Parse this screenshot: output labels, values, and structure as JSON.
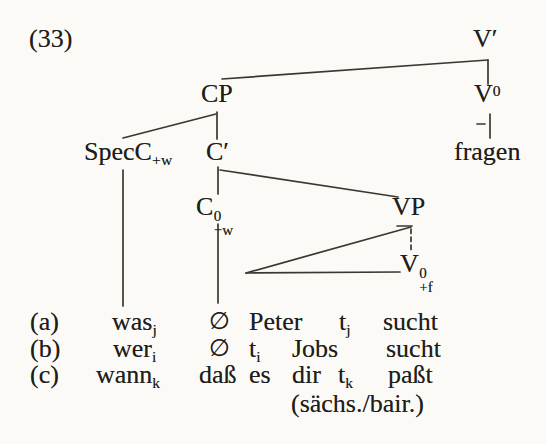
{
  "page": {
    "bg": "#fbfaf7",
    "ink": "#201d1a",
    "line_color": "#3a3732"
  },
  "figure_number": "(33)",
  "tree": {
    "v_bar": "V′",
    "cp": "CP",
    "v0": {
      "base": "V",
      "sup": "0"
    },
    "v0_lex": "fragen",
    "spec_c": {
      "base": "SpecC",
      "sub": "+w"
    },
    "c_bar": "C′",
    "c0": {
      "base": "C",
      "sup": "0",
      "sub": "−w"
    },
    "vp": "VP",
    "v_f": {
      "base": "V",
      "sup": "0",
      "sub": "+f"
    }
  },
  "examples": [
    {
      "label": "(a)",
      "words": [
        {
          "text": "was",
          "sub": "j"
        },
        {
          "text": "∅"
        },
        {
          "text": "Peter"
        },
        {
          "text": "t",
          "sub": "j"
        },
        {
          "text": "sucht"
        }
      ]
    },
    {
      "label": "(b)",
      "words": [
        {
          "text": "wer",
          "sub": "i"
        },
        {
          "text": "∅"
        },
        {
          "text": "t",
          "sub": "i"
        },
        {
          "text": "Jobs"
        },
        {
          "text": "sucht"
        }
      ]
    },
    {
      "label": "(c)",
      "words": [
        {
          "text": "wann",
          "sub": "k"
        },
        {
          "text": "daß"
        },
        {
          "text": "es"
        },
        {
          "text": "dir"
        },
        {
          "text": "t",
          "sub": "k"
        },
        {
          "text": "paßt"
        }
      ]
    }
  ],
  "dialect_note": "(sächs./bair.)"
}
